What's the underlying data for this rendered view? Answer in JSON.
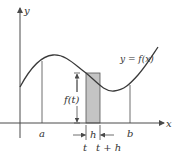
{
  "figure": {
    "type": "diagram",
    "labels": {
      "y_axis": "y",
      "x_axis": "x",
      "curve": "y = f(x)",
      "a": "a",
      "b": "b",
      "height": "f(t)",
      "width": "h",
      "t": "t",
      "t_plus_h": "t + h"
    },
    "colors": {
      "line": "#4a4a4a",
      "curve": "#3a3a3a",
      "rect_fill": "#c4c4c4",
      "background": "#ffffff"
    }
  }
}
